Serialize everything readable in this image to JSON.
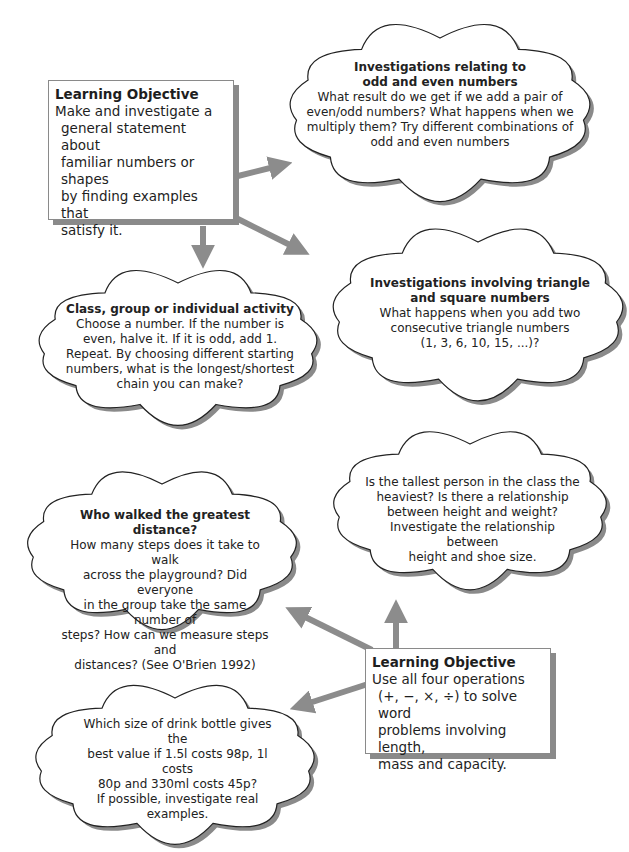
{
  "objective_1": {
    "title": "Learning Objective",
    "lines": [
      "Make and investigate a",
      "general statement about",
      "familiar numbers or shapes",
      "by finding examples that",
      "satisfy it."
    ]
  },
  "cloud_odd_even": {
    "title_lines": [
      "Investigations relating to",
      "odd and even numbers"
    ],
    "lines": [
      "What result do we get if we add a pair of",
      "even/odd numbers? What happens when we",
      "multiply them? Try different combinations of",
      "odd and even numbers"
    ]
  },
  "cloud_triangle": {
    "title_lines": [
      "Investigations involving triangle",
      "and square numbers"
    ],
    "lines": [
      "What happens when you add two",
      "consecutive triangle numbers",
      "(1, 3, 6, 10, 15, ...)?"
    ]
  },
  "cloud_activity": {
    "title_lines": [
      "Class, group or individual activity"
    ],
    "lines": [
      "Choose a number. If the number is",
      "even, halve it. If it is odd, add 1.",
      "Repeat. By choosing different starting",
      "numbers, what is the longest/shortest",
      "chain you can make?"
    ]
  },
  "cloud_distance": {
    "title_lines": [
      "Who walked the greatest distance?"
    ],
    "lines": [
      "How many steps does it take to walk",
      "across the playground? Did everyone",
      "in the group take the same number of",
      "steps? How can we measure steps and",
      "distances? (See O'Brien 1992)"
    ]
  },
  "cloud_height": {
    "title_lines": [],
    "lines": [
      "Is the tallest person in the class the",
      "heaviest? Is there a relationship",
      "between height and weight?",
      "Investigate the relationship between",
      "height and shoe size."
    ]
  },
  "cloud_bottle": {
    "title_lines": [],
    "lines": [
      "Which size of drink bottle gives the",
      "best value if 1.5l  costs 98p, 1l costs",
      "80p and 330ml costs 45p?",
      "If possible, investigate real",
      "examples."
    ]
  },
  "objective_2": {
    "title": "Learning Objective",
    "lines": [
      "Use all four operations",
      "(+, −, ×, ÷) to solve word",
      "problems involving length,",
      "mass and capacity."
    ]
  },
  "colors": {
    "arrow": "#8c8c8c",
    "shadow": "#8a8a8a",
    "outline": "#222222"
  }
}
